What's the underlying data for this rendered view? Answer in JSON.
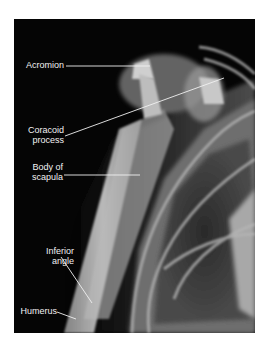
{
  "figure": {
    "type": "radiograph",
    "background": "#ffffff",
    "film_color": "#050505"
  },
  "labels": [
    {
      "id": "acromion",
      "lines": [
        "Acromion"
      ]
    },
    {
      "id": "coracoid-process",
      "lines": [
        "Coracoid",
        "process"
      ]
    },
    {
      "id": "body-of-scapula",
      "lines": [
        "Body of",
        "scapula"
      ]
    },
    {
      "id": "inferior-angle",
      "lines": [
        "Inferior",
        "angle"
      ]
    },
    {
      "id": "humerus",
      "lines": [
        "Humerus"
      ]
    }
  ]
}
